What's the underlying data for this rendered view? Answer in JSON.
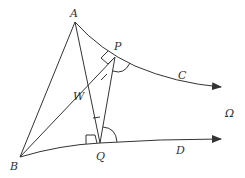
{
  "diagram": {
    "labels": {
      "A": "A",
      "P": "P",
      "C": "C",
      "W": "W",
      "Omega": "Ω",
      "B": "B",
      "Q": "Q",
      "D": "D"
    },
    "points": {
      "A": [
        75,
        22
      ],
      "P": [
        115,
        57
      ],
      "Q": [
        100,
        143
      ],
      "B": [
        20,
        157
      ],
      "W": [
        93,
        97
      ]
    },
    "curves": {
      "C": "from A through P to arrow at right",
      "D": "from B through Q to arrow at right"
    },
    "colors": {
      "stroke": "#333333",
      "background": "#ffffff"
    }
  }
}
